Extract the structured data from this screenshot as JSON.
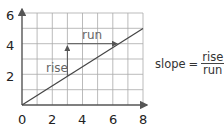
{
  "diagram": {
    "x_axis": {
      "ticks": [
        "0",
        "2",
        "4",
        "6",
        "8"
      ],
      "min": 0,
      "max": 8
    },
    "y_axis": {
      "ticks": [
        "2",
        "4",
        "6"
      ],
      "min": 0,
      "max": 6
    },
    "grid": {
      "x_cells": 8,
      "y_cells": 6
    },
    "line": {
      "from": [
        0,
        0
      ],
      "to": [
        8,
        5
      ]
    },
    "rise_label": "rise",
    "run_label": "run",
    "formula": {
      "lhs": "slope",
      "eq": "=",
      "numerator": "rise",
      "denominator": "run"
    },
    "colors": {
      "grid": "#999999",
      "axis": "#555555",
      "line": "#444444",
      "arrow": "#555555"
    }
  }
}
